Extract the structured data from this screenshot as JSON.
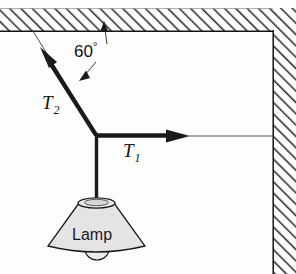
{
  "figure": {
    "background_color": "#fdfdfc"
  },
  "labels": {
    "tension_diagonal": "T",
    "tension_diagonal_sub": "2",
    "tension_horizontal": "T",
    "tension_horizontal_sub": "1",
    "angle_value": "60",
    "angle_unit": "°",
    "lamp": "Lamp"
  },
  "colors": {
    "ink": "#111111",
    "hatch": "#2b2b2b",
    "lamp_fill": "#e4e4e4",
    "lamp_stroke": "#1a1a1a",
    "thin_line": "#333333"
  },
  "geometry": {
    "junction_x": 96,
    "junction_y": 135,
    "ceiling_anchor_x": 33,
    "ceiling_anchor_y": 31,
    "t2_arrow_tip_x": 42,
    "t2_arrow_tip_y": 54,
    "t1_arrow_tip_x": 189,
    "t1_arrow_tip_y": 136,
    "wall_inner_edge_x": 273,
    "ceiling_inner_edge_y": 31,
    "lamp_top_y": 200,
    "lamp_base_y": 250,
    "angle_degrees": 60
  }
}
